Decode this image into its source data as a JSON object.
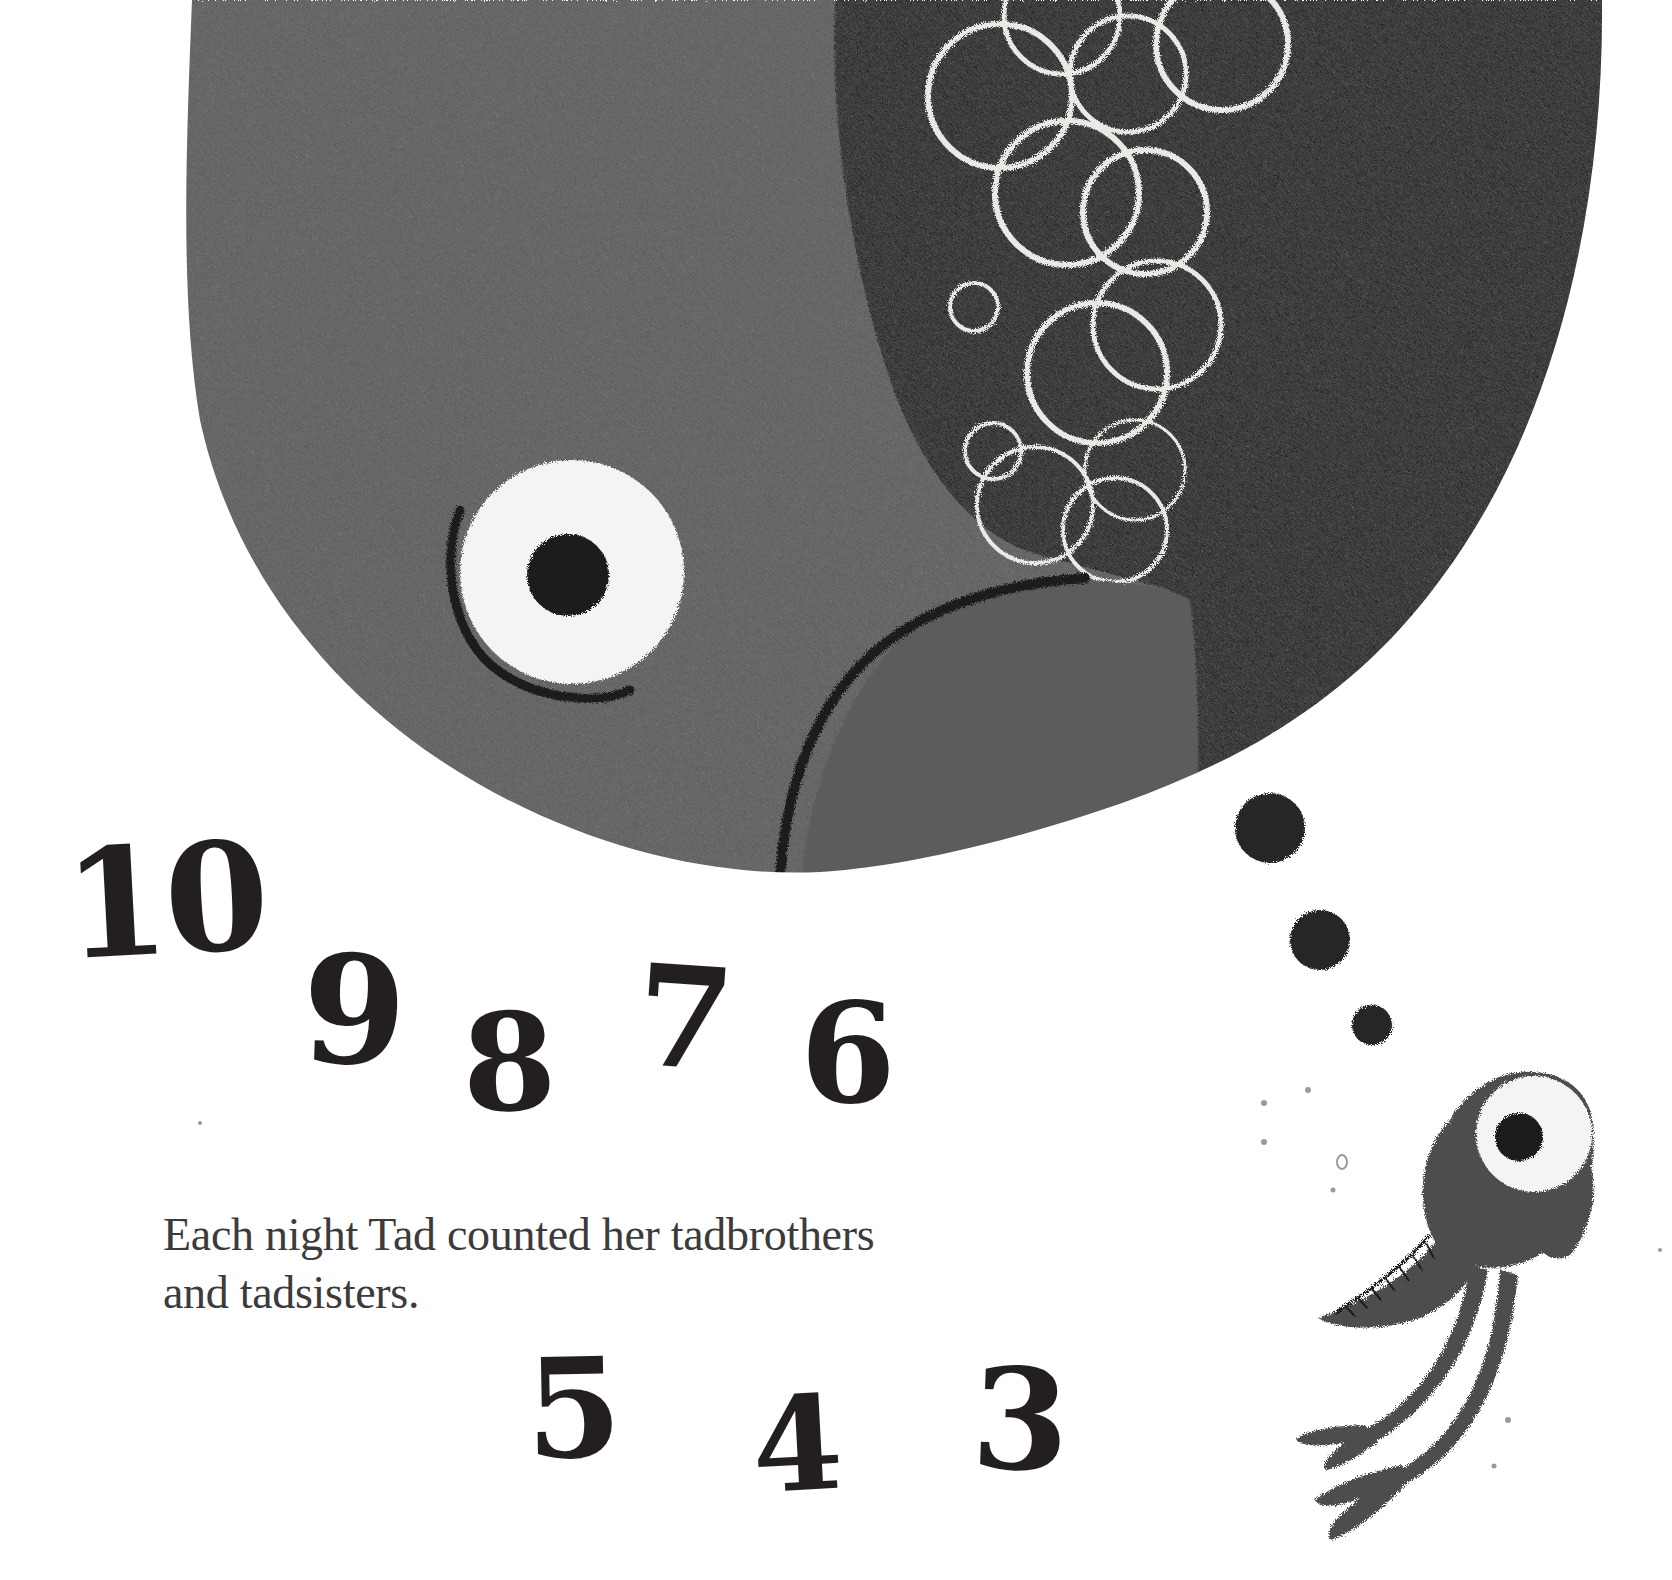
{
  "page": {
    "background": "#ffffff"
  },
  "illustration": {
    "fish": {
      "body_color": "#5a5a5a",
      "dark_water_color": "#161616",
      "eye_white": "#f4f4f2",
      "pupil": "#1a1a1a",
      "bubble_color": "#e9e9e6"
    },
    "thought_dots": [
      {
        "cx": 1270,
        "cy": 828,
        "r": 35
      },
      {
        "cx": 1320,
        "cy": 940,
        "r": 30
      },
      {
        "cx": 1372,
        "cy": 1025,
        "r": 20
      }
    ],
    "tadpole": {
      "body_color": "#4e4e4e"
    }
  },
  "countdown": {
    "numbers": [
      "10",
      "9",
      "8",
      "7",
      "6",
      "5",
      "4",
      "3"
    ]
  },
  "text": {
    "line1": "Each night Tad counted her tadbrothers",
    "line2": "and tadsisters."
  }
}
